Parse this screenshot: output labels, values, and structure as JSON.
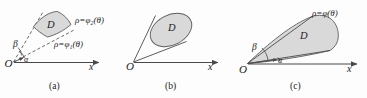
{
  "figure": {
    "background_color": "#fdfdfd",
    "ink_color": "#1c1c1c",
    "region_fill_color": "#d9d9d9",
    "region_stroke_color": "#5c5c5c",
    "axis_color": "#4a4a4a",
    "panels": [
      {
        "id": "a",
        "caption": "(a)",
        "origin_label": "O",
        "axis_label": "x",
        "region_label": "D",
        "angle_labels": [
          "β",
          "α"
        ],
        "curve_labels": [
          "ρ=φ₂(θ)",
          "ρ=φ₁(θ)"
        ]
      },
      {
        "id": "b",
        "caption": "(b)",
        "origin_label": "O",
        "axis_label": "x",
        "region_label": "D",
        "angle_labels": [],
        "curve_labels": []
      },
      {
        "id": "c",
        "caption": "(c)",
        "origin_label": "O",
        "axis_label": "x",
        "region_label": "D",
        "angle_labels": [
          "β",
          "α"
        ],
        "curve_labels": [
          "ρ=φ(θ)"
        ]
      }
    ]
  }
}
